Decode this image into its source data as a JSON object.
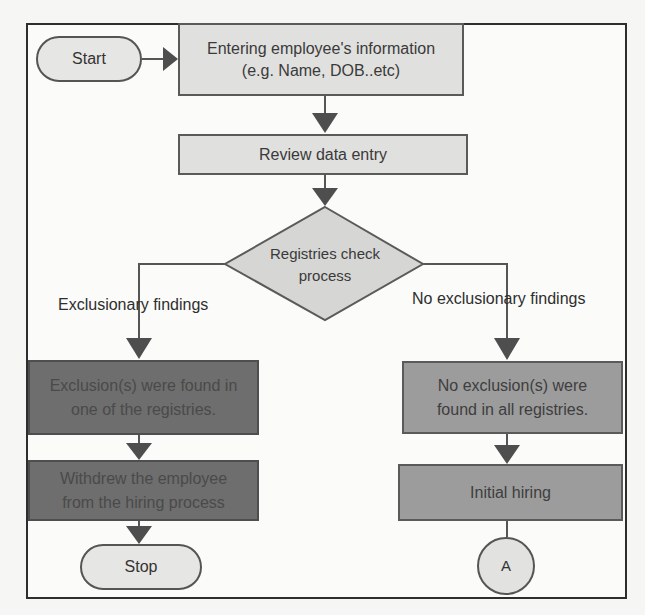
{
  "flowchart": {
    "start": {
      "label": "Start"
    },
    "entering": {
      "line1": "Entering employee's information",
      "line2": "(e.g. Name, DOB..etc)"
    },
    "review": {
      "label": "Review data entry"
    },
    "decision": {
      "line1": "Registries check",
      "line2": "process"
    },
    "branch_left": {
      "label": "Exclusionary findings"
    },
    "branch_right": {
      "label": "No exclusionary findings"
    },
    "exclusion_found": {
      "line1": "Exclusion(s) were found in",
      "line2": "one of the registries."
    },
    "withdrew": {
      "line1": "Withdrew the employee",
      "line2": "from the hiring process"
    },
    "stop": {
      "label": "Stop"
    },
    "no_exclusion": {
      "line1": "No exclusion(s) were",
      "line2": "found in all registries."
    },
    "initial_hiring": {
      "label": "Initial hiring"
    },
    "connector": {
      "label": "A"
    }
  },
  "colors": {
    "frame": "#2e2e2e",
    "light_box": "#e0e0de",
    "dark_box": "#6e6e6e",
    "mid_box": "#9c9c9c",
    "line": "#555555"
  }
}
